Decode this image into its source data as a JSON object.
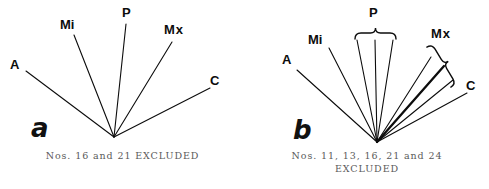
{
  "figure": {
    "background_color": "#ffffff",
    "ink_color": "#0c0c0c",
    "caption_color": "#5a5a5a"
  },
  "panel_a": {
    "panel_letter": "a",
    "caption": "Nos. 16 and 21 EXCLUDED",
    "vertex": {
      "x": 114,
      "y": 137
    },
    "labels": [
      {
        "name": "A",
        "text": "A",
        "x": 10,
        "y": 58
      },
      {
        "name": "Mi",
        "text": "Mi",
        "x": 60,
        "y": 18
      },
      {
        "name": "P",
        "text": "P",
        "x": 122,
        "y": 6
      },
      {
        "name": "Mx",
        "text": "Mx",
        "x": 164,
        "y": 23
      },
      {
        "name": "C",
        "text": "C",
        "x": 210,
        "y": 74
      }
    ],
    "rays": [
      {
        "name": "A-ray",
        "x1": 114,
        "y1": 137,
        "x2": 26,
        "y2": 71,
        "width": 1.1
      },
      {
        "name": "Mi-ray",
        "x1": 114,
        "y1": 137,
        "x2": 74,
        "y2": 35,
        "width": 1.1
      },
      {
        "name": "P-ray",
        "x1": 114,
        "y1": 137,
        "x2": 126,
        "y2": 24,
        "width": 1.1
      },
      {
        "name": "Mx-ray",
        "x1": 114,
        "y1": 137,
        "x2": 172,
        "y2": 42,
        "width": 1.1
      },
      {
        "name": "C-ray",
        "x1": 114,
        "y1": 137,
        "x2": 210,
        "y2": 88,
        "width": 1.1
      }
    ]
  },
  "panel_b": {
    "panel_letter": "b",
    "caption_line_1": "Nos.  11, 13, 16, 21 and 24",
    "caption_line_2": "EXCLUDED",
    "vertex": {
      "x": 132,
      "y": 142
    },
    "labels": [
      {
        "name": "A",
        "text": "A",
        "x": 37,
        "y": 53
      },
      {
        "name": "Mi",
        "text": "Mi",
        "x": 63,
        "y": 33
      },
      {
        "name": "P",
        "text": "P",
        "x": 124,
        "y": 6
      },
      {
        "name": "Mx",
        "text": "Mx",
        "x": 186,
        "y": 27
      },
      {
        "name": "C",
        "text": "C",
        "x": 221,
        "y": 79
      }
    ],
    "rays": [
      {
        "name": "A-ray",
        "x1": 132,
        "y1": 142,
        "x2": 52,
        "y2": 70,
        "width": 1.1
      },
      {
        "name": "Mi-ray",
        "x1": 132,
        "y1": 142,
        "x2": 84,
        "y2": 48,
        "width": 1.1
      },
      {
        "name": "P-ray-1",
        "x1": 132,
        "y1": 142,
        "x2": 112,
        "y2": 40,
        "width": 1.1
      },
      {
        "name": "P-ray-2",
        "x1": 132,
        "y1": 142,
        "x2": 130,
        "y2": 40,
        "width": 1.1
      },
      {
        "name": "P-ray-3",
        "x1": 132,
        "y1": 142,
        "x2": 148,
        "y2": 40,
        "width": 1.1
      },
      {
        "name": "Mx-ray-1",
        "x1": 132,
        "y1": 142,
        "x2": 186,
        "y2": 57,
        "width": 1.1
      },
      {
        "name": "Mx-ray-2",
        "x1": 132,
        "y1": 142,
        "x2": 199,
        "y2": 66,
        "width": 2.3
      },
      {
        "name": "Mx-ray-3",
        "x1": 132,
        "y1": 142,
        "x2": 208,
        "y2": 80,
        "width": 1.1
      },
      {
        "name": "C-ray",
        "x1": 132,
        "y1": 142,
        "x2": 222,
        "y2": 93,
        "width": 1.1
      }
    ],
    "brace_p": {
      "name": "p-brace",
      "x_left": 110,
      "x_right": 151,
      "y": 33
    },
    "brace_mx": {
      "name": "mx-brace",
      "x_start": 187,
      "y_start": 44,
      "x_end": 211,
      "y_end": 84
    }
  }
}
